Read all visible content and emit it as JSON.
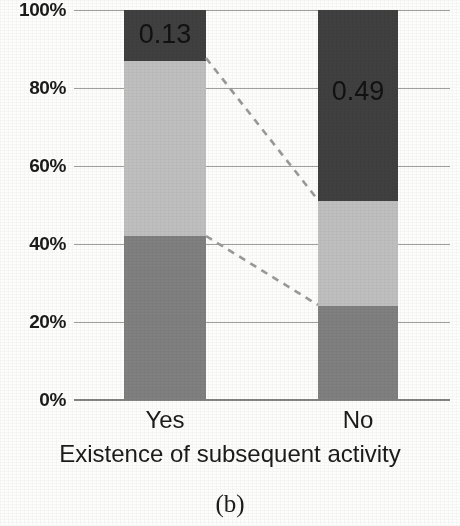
{
  "chart_data": {
    "type": "bar",
    "subtype": "100% stacked bar",
    "title": "",
    "caption": "(b)",
    "xlabel": "Existence of subsequent activity",
    "ylabel": "",
    "categories": [
      "Yes",
      "No"
    ],
    "ylim": [
      0,
      1
    ],
    "grid": true,
    "legend": "none",
    "ytick_labels": [
      "100%",
      "80%",
      "60%",
      "40%",
      "20%",
      "0%"
    ],
    "ytick_values": [
      1.0,
      0.8,
      0.6,
      0.4,
      0.2,
      0.0
    ],
    "series": [
      {
        "name": "bottom-segment",
        "color": "#808080",
        "values": [
          0.42,
          0.24
        ],
        "labels": [
          "",
          ""
        ]
      },
      {
        "name": "middle-segment",
        "color": "#bfbfbf",
        "values": [
          0.45,
          0.27
        ],
        "labels": [
          "",
          ""
        ]
      },
      {
        "name": "top-segment",
        "color": "#404040",
        "values": [
          0.13,
          0.49
        ],
        "labels": [
          "0.13",
          "0.49"
        ]
      }
    ],
    "data_labels": [
      {
        "category": "Yes",
        "segment": "top-segment",
        "value": "0.13"
      },
      {
        "category": "No",
        "segment": "top-segment",
        "value": "0.49"
      }
    ],
    "annotations": [
      {
        "name": "connector-top",
        "style": "dashed",
        "from": {
          "category": "Yes",
          "value": 0.87
        },
        "to": {
          "category": "No",
          "value": 0.51
        }
      },
      {
        "name": "connector-bottom",
        "style": "dashed",
        "from": {
          "category": "Yes",
          "value": 0.42
        },
        "to": {
          "category": "No",
          "value": 0.24
        }
      }
    ],
    "colors": {
      "bar_dark": "#404040",
      "bar_light": "#bfbfbf",
      "bar_mid": "#808080",
      "gridline": "#8e8e8e",
      "text": "#1b1b1b",
      "background": "#fdfdfb",
      "connector": "#9a9a9a"
    }
  },
  "ticks": {
    "t0": "100%",
    "t1": "80%",
    "t2": "60%",
    "t3": "40%",
    "t4": "20%",
    "t5": "0%"
  },
  "labels": {
    "cat_yes": "Yes",
    "cat_no": "No",
    "axis_title": "Existence of subsequent activity",
    "caption": "(b)",
    "value_yes_top": "0.13",
    "value_no_top": "0.49"
  }
}
